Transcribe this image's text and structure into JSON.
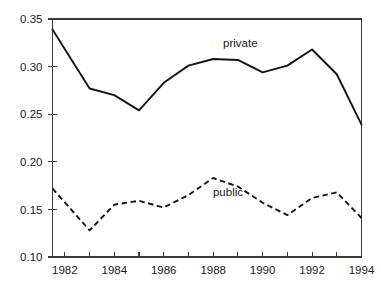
{
  "chart_data": {
    "type": "line",
    "title": "",
    "subtitle": "",
    "xlabel": "",
    "ylabel": "",
    "xlim": [
      1981.5,
      1994
    ],
    "ylim": [
      0.1,
      0.35
    ],
    "grid": false,
    "legend_position": "inline-annotation",
    "x": [
      1981.5,
      1983,
      1984,
      1985,
      1986,
      1987,
      1988,
      1989,
      1990,
      1991,
      1992,
      1993,
      1994
    ],
    "xticks": [
      1982,
      1983,
      1984,
      1985,
      1986,
      1987,
      1988,
      1989,
      1990,
      1991,
      1992,
      1993,
      1994
    ],
    "xtick_labels": [
      "1982",
      "",
      "1984",
      "",
      "1986",
      "",
      "1988",
      "",
      "1990",
      "",
      "1992",
      "",
      "1994"
    ],
    "yticks": [
      0.1,
      0.15,
      0.2,
      0.25,
      0.3,
      0.35
    ],
    "ytick_labels": [
      "0.10",
      "0.15",
      "0.20",
      "0.25",
      "0.30",
      "0.35"
    ],
    "series": [
      {
        "name": "private",
        "style": "solid",
        "color": "#141414",
        "label_x": 1989.1,
        "label_y": 0.325,
        "x": [
          1981.5,
          1983,
          1984,
          1985,
          1986,
          1987,
          1988,
          1989,
          1990,
          1991,
          1992,
          1993,
          1994
        ],
        "values": [
          0.339,
          0.277,
          0.27,
          0.254,
          0.283,
          0.301,
          0.308,
          0.307,
          0.294,
          0.301,
          0.318,
          0.292,
          0.239
        ]
      },
      {
        "name": "public",
        "style": "dashed",
        "color": "#141414",
        "label_x": 1988.6,
        "label_y": 0.168,
        "x": [
          1981.5,
          1983,
          1984,
          1985,
          1986,
          1987,
          1988,
          1989,
          1990,
          1991,
          1992,
          1993,
          1994
        ],
        "values": [
          0.172,
          0.128,
          0.155,
          0.159,
          0.152,
          0.165,
          0.183,
          0.174,
          0.157,
          0.144,
          0.162,
          0.168,
          0.141
        ]
      }
    ]
  },
  "labels": {
    "private": "private",
    "public": "public"
  }
}
